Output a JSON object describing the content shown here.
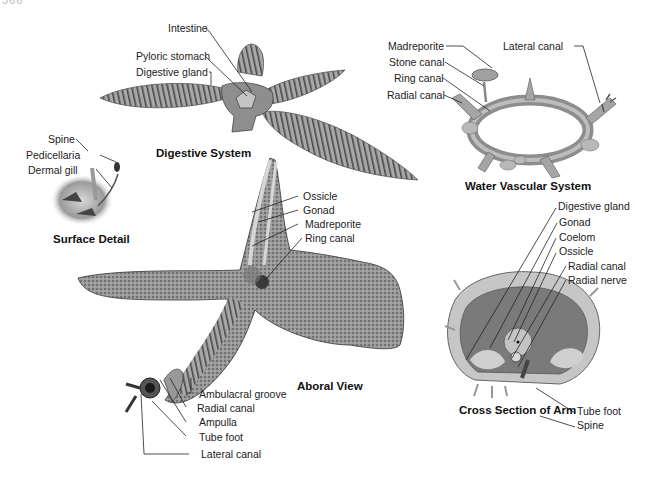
{
  "page_header": {
    "number": "366",
    "running_title": "CHAPTER"
  },
  "colors": {
    "background": "#ffffff",
    "label_text": "#222222",
    "leader_line": "#222222",
    "illustration_tone": "#8a8a8a"
  },
  "figures": {
    "digestive_system": {
      "caption": "Digestive System",
      "labels": [
        "Intestine",
        "Pyloric stomach",
        "Digestive gland"
      ]
    },
    "water_vascular_system": {
      "caption": "Water Vascular System",
      "labels": [
        "Madreporite",
        "Stone canal",
        "Ring canal",
        "Radial canal",
        "Lateral canal"
      ]
    },
    "surface_detail": {
      "caption": "Surface Detail",
      "labels": [
        "Spine",
        "Pedicellaria",
        "Dermal gill"
      ]
    },
    "aboral_view": {
      "caption": "Aboral View",
      "labels": [
        "Ossicle",
        "Gonad",
        "Madreporite",
        "Ring canal"
      ],
      "tube_foot_labels": [
        "Ambulacral groove",
        "Radial canal",
        "Ampulla",
        "Tube foot",
        "Lateral canal"
      ]
    },
    "cross_section_of_arm": {
      "caption": "Cross Section of Arm",
      "labels": [
        "Digestive gland",
        "Gonad",
        "Coelom",
        "Ossicle",
        "Radial canal",
        "Radial nerve",
        "Tube foot",
        "Spine"
      ]
    }
  }
}
